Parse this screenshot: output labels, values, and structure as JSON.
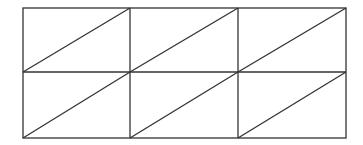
{
  "diagram": {
    "rows": 2,
    "cols": 3,
    "stroke_color": "#333333",
    "background": "#ffffff",
    "rect": {
      "x": 23,
      "y": 8,
      "width": 323,
      "height": 130
    },
    "vertical_dividers_x": [
      130,
      238
    ],
    "horizontal_divider_y": 72,
    "diagonal_direction": "bottom-left-to-top-right"
  }
}
